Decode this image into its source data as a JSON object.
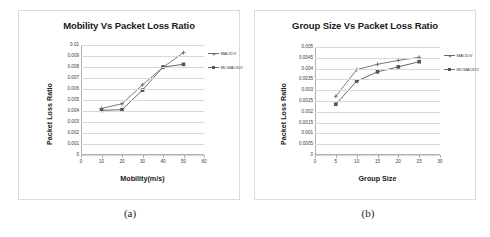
{
  "figure": {
    "captions": [
      {
        "id": "a",
        "text": "(a)"
      },
      {
        "id": "b",
        "text": "(b)"
      }
    ]
  },
  "colors": {
    "series_maodv": "#6b6b6b",
    "series_mcmaodv": "#555555",
    "gridline": "#d9d9d9",
    "axis": "#b0b0b0",
    "panel_border": "#dcdcdc",
    "title_text": "#1a1a1a",
    "tick_text": "#3a3a3a",
    "background": "#ffffff"
  },
  "chart_data": [
    {
      "id": "chart-a",
      "type": "line",
      "title": "Mobility Vs Packet Loss Ratio",
      "xlabel": "Mobility(m/s)",
      "ylabel": "Packet Loss Ratio",
      "x": [
        10,
        20,
        30,
        40,
        50
      ],
      "xlim": [
        0,
        60
      ],
      "ylim": [
        0,
        0.01
      ],
      "xticks": [
        0,
        10,
        20,
        30,
        40,
        50,
        60
      ],
      "xtick_labels": [
        "0",
        "10",
        "20",
        "30",
        "40",
        "50",
        "60"
      ],
      "yticks": [
        0,
        0.001,
        0.002,
        0.003,
        0.004,
        0.005,
        0.006,
        0.007,
        0.008,
        0.009,
        0.01
      ],
      "ytick_labels": [
        "0",
        "0.001",
        "0.002",
        "0.003",
        "0.004",
        "0.005",
        "0.006",
        "0.007",
        "0.008",
        "0.009",
        "0.01"
      ],
      "grid": true,
      "legend_position": "right",
      "series": [
        {
          "name": "MAODV",
          "marker": "cross",
          "values": [
            0.00423,
            0.00466,
            0.00638,
            0.00797,
            0.00931
          ]
        },
        {
          "name": "MCMAODV",
          "marker": "square",
          "values": [
            0.00406,
            0.00412,
            0.0059,
            0.008,
            0.00824
          ]
        }
      ]
    },
    {
      "id": "chart-b",
      "type": "line",
      "title": "Group Size Vs Packet Loss Ratio",
      "xlabel": "Group Size",
      "ylabel": "Packet Loss Ratio",
      "x": [
        5,
        10,
        15,
        20,
        25
      ],
      "xlim": [
        0,
        30
      ],
      "ylim": [
        0,
        0.005
      ],
      "xticks": [
        0,
        5,
        10,
        15,
        20,
        25,
        30
      ],
      "xtick_labels": [
        "0",
        "5",
        "10",
        "15",
        "20",
        "25",
        "30"
      ],
      "yticks": [
        0,
        0.0005,
        0.001,
        0.0015,
        0.002,
        0.0025,
        0.003,
        0.0035,
        0.004,
        0.0045,
        0.005
      ],
      "ytick_labels": [
        "0",
        "0.0005",
        "0.001",
        "0.0015",
        "0.002",
        "0.0025",
        "0.003",
        "0.0035",
        "0.004",
        "0.0045",
        "0.005"
      ],
      "grid": true,
      "legend_position": "right",
      "series": [
        {
          "name": "MAODV",
          "marker": "cross",
          "values": [
            0.00272,
            0.00395,
            0.0042,
            0.00438,
            0.00452
          ]
        },
        {
          "name": "MCMAODV",
          "marker": "square",
          "values": [
            0.00235,
            0.00342,
            0.00385,
            0.00408,
            0.00432
          ]
        }
      ]
    }
  ]
}
